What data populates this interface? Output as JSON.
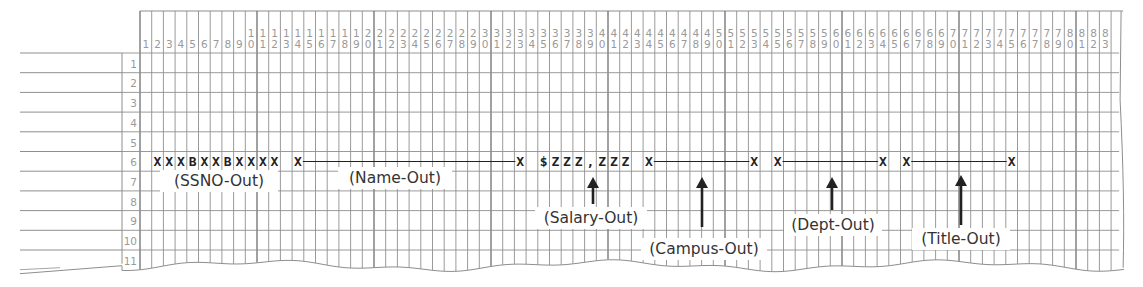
{
  "spacing_chart": {
    "columns": 83,
    "rows": 11,
    "grid": {
      "left": 140,
      "top": 11,
      "header_bottom": 53,
      "col_width": 11.7,
      "row_height": 19.7,
      "rownum_left": 122
    },
    "colors": {
      "line": "#8e8e8e",
      "line_heavy": "#6f6f6f",
      "digit": "#9a9a9a",
      "ink": "#222222",
      "label": "#333333"
    },
    "print_line_row": 6,
    "fields": [
      {
        "name": "ssno",
        "label": "(SSNO-Out)",
        "start_col": 2,
        "end_col": 12,
        "picture": "XXXBXXBXXXX",
        "type": "chars",
        "label_box": {
          "x": 160,
          "y": 170,
          "w": 118
        }
      },
      {
        "name": "name",
        "label": "(Name-Out)",
        "start_col": 14,
        "end_col": 33,
        "picture": "X",
        "type": "span",
        "label_box": {
          "x": 338,
          "y": 167,
          "w": 114
        }
      },
      {
        "name": "salary",
        "label": "(Salary-Out)",
        "start_col": 35,
        "end_col": 42,
        "picture": "$ZZZ,ZZZ",
        "type": "chars",
        "arrow_x": 593,
        "arrow_top": 177,
        "arrow_bottom": 204,
        "label_box": {
          "x": 535,
          "y": 207,
          "w": 112
        }
      },
      {
        "name": "campus",
        "label": "(Campus-Out)",
        "start_col": 44,
        "end_col": 53,
        "picture": "X",
        "type": "span",
        "arrow_x": 702,
        "arrow_top": 177,
        "arrow_bottom": 227,
        "label_box": {
          "x": 641,
          "y": 238,
          "w": 126
        }
      },
      {
        "name": "dept",
        "label": "(Dept-Out)",
        "start_col": 55,
        "end_col": 64,
        "picture": "X",
        "type": "span",
        "arrow_x": 832,
        "arrow_top": 177,
        "arrow_bottom": 210,
        "label_box": {
          "x": 784,
          "y": 214,
          "w": 98
        }
      },
      {
        "name": "title",
        "label": "(Title-Out)",
        "start_col": 66,
        "end_col": 75,
        "picture": "X",
        "type": "span",
        "arrow_x": 961,
        "arrow_top": 175,
        "arrow_bottom": 225,
        "label_box": {
          "x": 912,
          "y": 228,
          "w": 98
        }
      }
    ]
  }
}
